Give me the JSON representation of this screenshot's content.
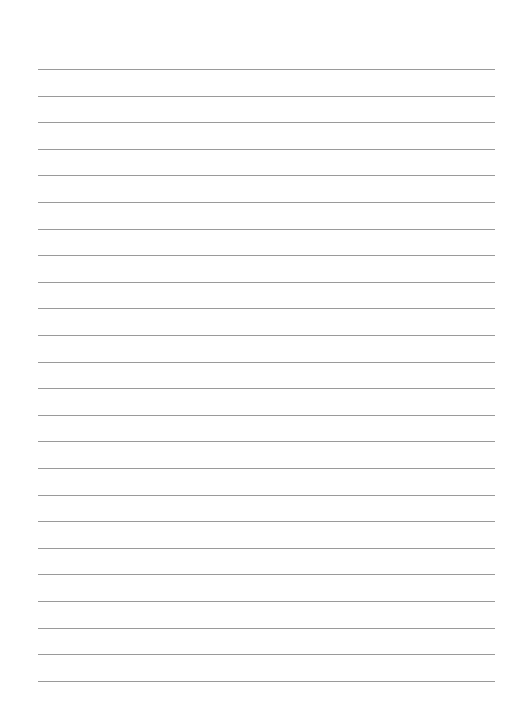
{
  "page": {
    "type": "lined-paper",
    "background_color": "#ffffff",
    "line_color": "#9a9a9a",
    "line_count": 24,
    "first_line_y": 69,
    "line_spacing": 26.6,
    "line_left": 38,
    "line_width": 457
  }
}
